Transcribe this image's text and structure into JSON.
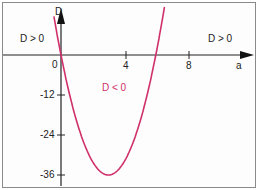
{
  "chart_data": {
    "type": "line",
    "title": "",
    "xlabel": "a",
    "ylabel": "D",
    "x_ticks": [
      0,
      4,
      8
    ],
    "y_ticks": [
      -12,
      -24,
      -36
    ],
    "xlim": [
      -3.8,
      12
    ],
    "ylim": [
      -38,
      16
    ],
    "grid": false,
    "series": [
      {
        "name": "D(a) = 4a(a - 6)",
        "color": "#d0306a",
        "x": [
          -0.5,
          0,
          1,
          2,
          3,
          4,
          5,
          6,
          6.6
        ],
        "values": [
          13,
          0,
          -20,
          -32,
          -36,
          -32,
          -20,
          0,
          16
        ]
      }
    ],
    "annotations": [
      {
        "text": "D > 0",
        "region": "left"
      },
      {
        "text": "D > 0",
        "region": "right"
      },
      {
        "text": "D < 0",
        "region": "between roots"
      }
    ]
  },
  "labels": {
    "x_axis": "a",
    "y_axis": "D",
    "origin": "0",
    "tick_4": "4",
    "tick_8": "8",
    "tick_m12": "-12",
    "tick_m24": "-24",
    "tick_m36": "-36",
    "region_left": "D > 0",
    "region_right": "D > 0",
    "region_mid": "D < 0"
  },
  "colors": {
    "curve": "#d0306a",
    "axis": "#222222",
    "frame": "#8a8a8a"
  }
}
